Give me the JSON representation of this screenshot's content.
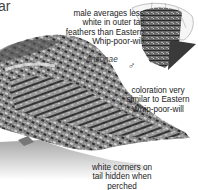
{
  "plate": {
    "corner_text": "ar",
    "annotations": {
      "tail_note": "male averages less\nwhite in outer tail\nfeathers than Eastern\nWhip-poor-will",
      "subspecies": "arizonae",
      "coloration_note": "coloration very\nsimilar to Eastern\nWhip-poor-will",
      "corners_note": "white corners on\ntail hidden when\nperched"
    },
    "symbols": {
      "tail_sex": "♂",
      "bird_sex": "♂"
    },
    "colors": {
      "plumage_dark": "#3a3a3a",
      "plumage_mid": "#7a7a7a",
      "plumage_light": "#b8b8b8",
      "branch": "#8f8f8f"
    }
  }
}
